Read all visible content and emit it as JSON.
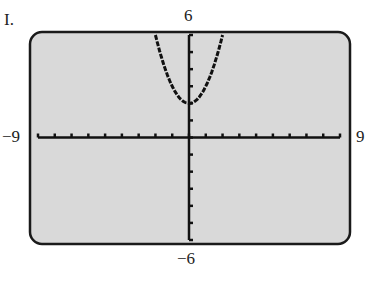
{
  "label": "I.",
  "window": {
    "xmin": "−9",
    "xmax": "9",
    "ymax": "6",
    "ymin": "−6"
  },
  "colors": {
    "screen": "#d9d9d9",
    "border": "#1a1a1a",
    "curve": "#111111"
  },
  "chart_data": {
    "type": "line",
    "title": "",
    "xlabel": "",
    "ylabel": "",
    "xlim": [
      -9,
      9
    ],
    "ylim": [
      -6,
      6
    ],
    "grid": false,
    "ticks": {
      "x_step": 1,
      "y_step": 1
    },
    "series": [
      {
        "name": "y = x^2 + 2",
        "x": [
          -2,
          -1.5,
          -1,
          -0.5,
          0,
          0.5,
          1,
          1.5,
          2
        ],
        "y": [
          6,
          4.25,
          3,
          2.25,
          2,
          2.25,
          3,
          4.25,
          6
        ]
      }
    ]
  }
}
